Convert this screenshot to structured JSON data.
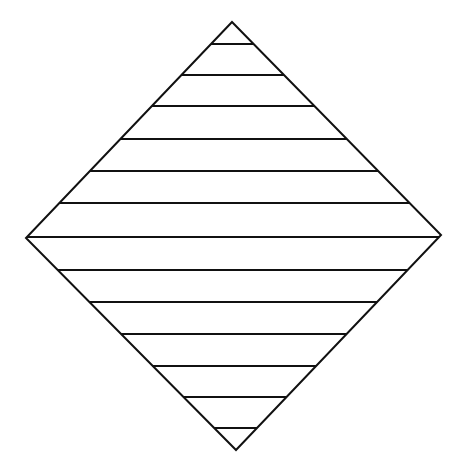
{
  "diagram": {
    "shape": "diamond",
    "vertices": {
      "top": [
        232,
        22
      ],
      "right": [
        441,
        235
      ],
      "bottom": [
        236,
        450
      ],
      "left": [
        26,
        238
      ]
    },
    "stroke_color": "#111111",
    "background_color": "#ffffff",
    "outline_width": 2,
    "hatch_line_width": 2,
    "hatch_lines_y": [
      44,
      75,
      106,
      139,
      171,
      203,
      237,
      270,
      302,
      334,
      366,
      397,
      428
    ]
  }
}
